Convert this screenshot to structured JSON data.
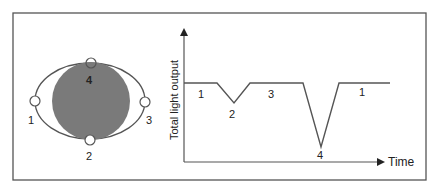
{
  "diagram": {
    "colors": {
      "frame": "#555555",
      "star": "#7a7a7a",
      "orbit": "#555555",
      "line": "#555555",
      "text": "#222222"
    },
    "orbit": {
      "positions": [
        {
          "id": "1",
          "label": "1"
        },
        {
          "id": "2",
          "label": "2"
        },
        {
          "id": "3",
          "label": "3"
        },
        {
          "id": "4",
          "label": "4"
        }
      ]
    },
    "light_curve": {
      "y_axis_label": "Total light output",
      "x_axis_label": "Time",
      "segment_labels": [
        {
          "label": "1"
        },
        {
          "label": "2"
        },
        {
          "label": "3"
        },
        {
          "label": "4"
        },
        {
          "label": "1"
        }
      ]
    }
  }
}
